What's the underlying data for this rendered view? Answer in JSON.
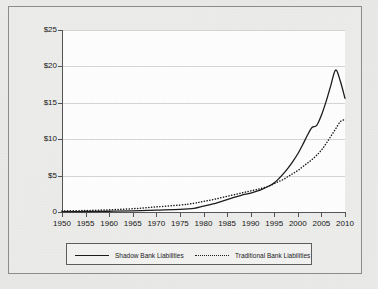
{
  "chart_data": {
    "type": "line",
    "title": "",
    "xlabel": "",
    "ylabel": "",
    "xlim": [
      1950,
      2010
    ],
    "ylim": [
      0,
      25
    ],
    "grid": true,
    "legend_position": "bottom",
    "x_tick_labels": [
      "1950",
      "1955",
      "1960",
      "1965",
      "1970",
      "1975",
      "1980",
      "1985",
      "1990",
      "1995",
      "2000",
      "2005",
      "2010"
    ],
    "x_ticks": [
      1950,
      1955,
      1960,
      1965,
      1970,
      1975,
      1980,
      1985,
      1990,
      1995,
      2000,
      2005,
      2010
    ],
    "y_tick_labels": [
      "0",
      "$5",
      "$10",
      "$15",
      "$20",
      "$25"
    ],
    "y_ticks": [
      0,
      5,
      10,
      15,
      20,
      25
    ],
    "x": [
      1950,
      1955,
      1960,
      1965,
      1970,
      1975,
      1978,
      1980,
      1982,
      1984,
      1986,
      1988,
      1990,
      1992,
      1994,
      1995,
      1996,
      1997,
      1998,
      1999,
      2000,
      2001,
      2002,
      2003,
      2004,
      2005,
      2006,
      2007,
      2008,
      2009,
      2010
    ],
    "series": [
      {
        "name": "Shadow Bank Liabilities",
        "style": "solid",
        "color": "#1c1c1c",
        "values": [
          0.05,
          0.07,
          0.1,
          0.15,
          0.25,
          0.35,
          0.5,
          0.8,
          1.1,
          1.5,
          1.9,
          2.3,
          2.6,
          3.0,
          3.6,
          4.0,
          4.6,
          5.3,
          6.1,
          7.0,
          8.0,
          9.2,
          10.5,
          11.6,
          11.9,
          13.3,
          15.2,
          17.4,
          19.5,
          18.0,
          15.6
        ]
      },
      {
        "name": "Traditional Bank Liabilities",
        "style": "dotted",
        "color": "#1c1c1c",
        "values": [
          0.15,
          0.2,
          0.3,
          0.45,
          0.7,
          0.95,
          1.2,
          1.45,
          1.7,
          2.0,
          2.3,
          2.6,
          2.9,
          3.2,
          3.6,
          3.9,
          4.2,
          4.5,
          4.9,
          5.3,
          5.7,
          6.2,
          6.7,
          7.2,
          7.8,
          8.5,
          9.4,
          10.4,
          11.4,
          12.4,
          12.7
        ]
      }
    ]
  },
  "legend": {
    "entries": [
      {
        "label": "Shadow Bank Liabilities"
      },
      {
        "label": "Traditional Bank Liabilities"
      }
    ]
  }
}
